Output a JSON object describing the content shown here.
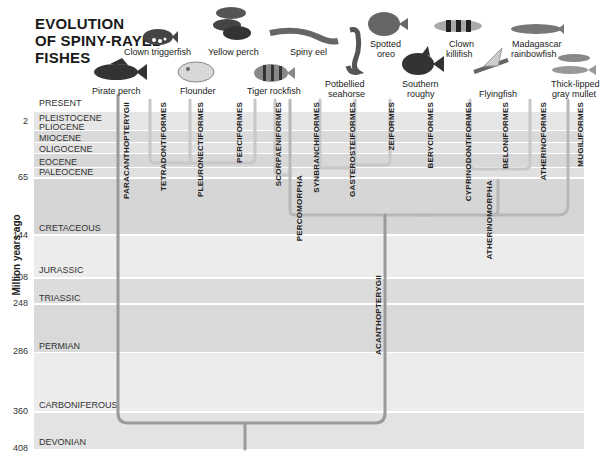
{
  "title": {
    "line1": "EVOLUTION",
    "line2": "OF SPINY-RAYED",
    "line3": "FISHES"
  },
  "axis": {
    "label": "Million years ago",
    "ticks": [
      "2",
      "65",
      "144",
      "208",
      "248",
      "286",
      "360",
      "408"
    ]
  },
  "eras": [
    "PRESENT",
    "PLEISTOCENE",
    "PLIOCENE",
    "MIOCENE",
    "OLIGOCENE",
    "EOCENE",
    "PALEOCENE",
    "CRETACEOUS",
    "JURASSIC",
    "TRIASSIC",
    "PERMIAN",
    "CARBONIFEROUS",
    "DEVONIAN"
  ],
  "taxa": {
    "paracanthopterygii": "PARACANTHOPTERYGII",
    "tetradontiformes": "TETRADONTIFORMES",
    "pleuronectiformes": "PLEURONECTIFORMES",
    "perciformes": "PERCIFORMES",
    "scorpaeniformes": "SCORPAENIFORMES",
    "percomorpha": "PERCOMORPHA",
    "synbranchiformes": "SYNBRANCHIFORMES",
    "gasterosteiformes": "GASTEROSTEIFORMES",
    "zeiformes": "ZEIFORMES",
    "beryciformes": "BERYCIFORMES",
    "cyprinodontiformes": "CYPRINODONTIFORMES",
    "atherinomorpha": "ATHERINOMORPHA",
    "beloniformes": "BELONIFORMES",
    "atheriniformes": "ATHERINOFORMES",
    "mugiliformes": "MUGILIFORMES",
    "acanthopterygii": "ACANTHOPTERYGII"
  },
  "fishes": {
    "pirate_perch": "Pirate perch",
    "clown_triggerfish": "Clown triggerfish",
    "flounder": "Flounder",
    "yellow_perch": "Yellow perch",
    "tiger_rockfish": "Tiger rockfish",
    "spiny_eel": "Spiny eel",
    "potbellied_seahorse_1": "Potbellied",
    "potbellied_seahorse_2": "seahorse",
    "spotted_oreo_1": "Spotted",
    "spotted_oreo_2": "oreo",
    "southern_roughy_1": "Southern",
    "southern_roughy_2": "roughy",
    "clown_killifish_1": "Clown",
    "clown_killifish_2": "killifish",
    "flyingfish": "Flyingfish",
    "madagascar_rainbowfish_1": "Madagascar",
    "madagascar_rainbowfish_2": "rainbowfish",
    "gray_mullet_1": "Thick-lipped",
    "gray_mullet_2": "gray mullet"
  },
  "colors": {
    "band_dark": "#d4d4d4",
    "band_mid": "#dcdcdc",
    "band_light": "#ececec",
    "tree_line": "#9a9a9a",
    "tree_line_light": "#c4c4c4"
  }
}
